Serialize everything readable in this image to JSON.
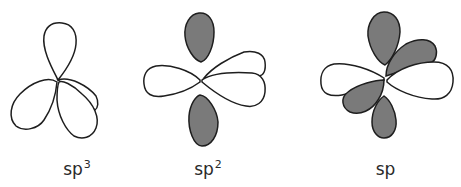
{
  "figure": {
    "colors": {
      "outline": "#1e1e1e",
      "shaded_lobe": "#7a7a7a",
      "unshaded_lobe": "#ffffff",
      "background": "#ffffff"
    },
    "panels": [
      {
        "id": "sp3",
        "label_base": "sp",
        "label_superscript": "3",
        "lobes": {
          "unshaded": 4,
          "shaded": 0
        }
      },
      {
        "id": "sp2",
        "label_base": "sp",
        "label_superscript": "2",
        "lobes": {
          "unshaded": 3,
          "shaded": 2
        }
      },
      {
        "id": "sp",
        "label_base": "sp",
        "label_superscript": "",
        "lobes": {
          "unshaded": 2,
          "shaded": 4
        }
      }
    ]
  }
}
